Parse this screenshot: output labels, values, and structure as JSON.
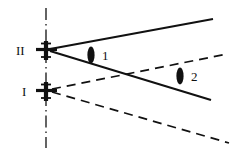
{
  "figure": {
    "type": "ray-diagram",
    "title": "",
    "width": 234,
    "height": 154,
    "background_color": "#ffffff",
    "line_color": "#111111"
  },
  "stations": [
    {
      "id": "station-II",
      "label": "II",
      "label_x": 16,
      "label_y": 55,
      "marker_x": 46,
      "marker_y": 50,
      "marker_style": "cross-antenna"
    },
    {
      "id": "station-I",
      "label": "I",
      "label_x": 22,
      "label_y": 96,
      "marker_x": 46,
      "marker_y": 91,
      "marker_style": "cross-antenna"
    }
  ],
  "center_line": {
    "name": "vertical-dash-dot-axis",
    "x": 46,
    "y1": 8,
    "y2": 148
  },
  "rays": [
    {
      "id": "ray-solid-upper",
      "style": "solid",
      "from": "station-II",
      "x1": 50,
      "y1": 49,
      "x2": 213,
      "y2": 19
    },
    {
      "id": "ray-solid-lower",
      "style": "solid",
      "from": "station-II",
      "x1": 50,
      "y1": 51,
      "x2": 211,
      "y2": 100
    },
    {
      "id": "ray-dashed-upper",
      "style": "dashed",
      "from": "station-I",
      "x1": 52,
      "y1": 89,
      "x2": 227,
      "y2": 54
    },
    {
      "id": "ray-dashed-lower",
      "style": "dashed",
      "from": "station-I",
      "x1": 52,
      "y1": 92,
      "x2": 229,
      "y2": 143
    }
  ],
  "region_markers": [
    {
      "id": "region-1",
      "label": "1",
      "lens_x": 91,
      "lens_y": 55,
      "lens_rx": 3.6,
      "lens_ry": 8.5,
      "label_x": 102,
      "label_y": 60
    },
    {
      "id": "region-2",
      "label": "2",
      "lens_x": 180,
      "lens_y": 76,
      "lens_rx": 3.6,
      "lens_ry": 8.5,
      "label_x": 191,
      "label_y": 81
    }
  ]
}
